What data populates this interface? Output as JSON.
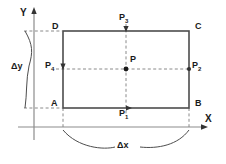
{
  "figure": {
    "type": "geometry-diagram",
    "colors": {
      "background": "#ffffff",
      "axis": "#808080",
      "rectangle": "#4d4d4d",
      "dashed": "#808080",
      "text": "#1a1a1a",
      "brace": "#4d4d4d"
    },
    "axes": {
      "x_label": "X",
      "y_label": "Y",
      "x_axis_y": 127,
      "y_axis_x": 34
    },
    "rectangle": {
      "left": 63,
      "right": 189,
      "top": 31,
      "bottom": 108,
      "corners": [
        {
          "name": "D",
          "label": "D",
          "x": 63,
          "y": 31,
          "label_x": 52,
          "label_y": 26
        },
        {
          "name": "C",
          "label": "C",
          "x": 189,
          "y": 31,
          "label_x": 195,
          "label_y": 26
        },
        {
          "name": "B",
          "label": "B",
          "x": 189,
          "y": 108,
          "label_x": 195,
          "label_y": 103
        },
        {
          "name": "A",
          "label": "A",
          "x": 63,
          "y": 108,
          "label_x": 51,
          "label_y": 103
        }
      ]
    },
    "points": [
      {
        "name": "P",
        "label": "P",
        "sub": "",
        "x": 126,
        "y": 69,
        "label_x": 130,
        "label_y": 58
      },
      {
        "name": "P1",
        "label": "P",
        "sub": "1",
        "x": 126,
        "y": 108,
        "label_x": 120,
        "label_y": 111
      },
      {
        "name": "P2",
        "label": "P",
        "sub": "2",
        "x": 189,
        "y": 69,
        "label_x": 192,
        "label_y": 63
      },
      {
        "name": "P3",
        "label": "P",
        "sub": "3",
        "x": 126,
        "y": 31,
        "label_x": 120,
        "label_y": 17
      },
      {
        "name": "P4",
        "label": "P",
        "sub": "4",
        "x": 63,
        "y": 69,
        "label_x": 45,
        "label_y": 63
      }
    ],
    "spans": [
      {
        "name": "delta-y",
        "label": "Δy",
        "label_x": 14,
        "label_y": 62,
        "from_y": 31,
        "to_y": 108
      },
      {
        "name": "delta-x",
        "label": "Δx",
        "label_x": 118,
        "label_y": 143,
        "from_x": 63,
        "to_x": 189
      }
    ]
  }
}
